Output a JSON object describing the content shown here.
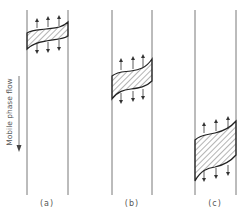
{
  "diagram": {
    "axis_label": "Mobile phase flow",
    "axis_direction": "downward",
    "colors": {
      "line": "#444444",
      "text": "#555555",
      "background": "#ffffff"
    },
    "panels": [
      {
        "id": "a",
        "label": "(a)",
        "band_position": "top",
        "band_width": "narrow"
      },
      {
        "id": "b",
        "label": "(b)",
        "band_position": "middle",
        "band_width": "medium"
      },
      {
        "id": "c",
        "label": "(c)",
        "band_position": "bottom",
        "band_width": "wide"
      }
    ],
    "annotations": {
      "band_fill": "diagonal hatching",
      "arrows": "three arrows above and three below each band, pointing outward (diffusion)"
    }
  }
}
